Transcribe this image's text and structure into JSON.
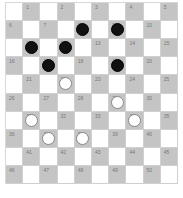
{
  "board": {
    "size": 10,
    "colors": {
      "light_square": "#ffffff",
      "dark_square": "#c4c4c4",
      "black_piece": "#111111",
      "white_piece": "#ffffff"
    },
    "squares": [
      {
        "n": 1,
        "piece": null
      },
      {
        "n": 2,
        "piece": null
      },
      {
        "n": 3,
        "piece": null
      },
      {
        "n": 4,
        "piece": null
      },
      {
        "n": 5,
        "piece": null
      },
      {
        "n": 6,
        "piece": null
      },
      {
        "n": 7,
        "piece": null
      },
      {
        "n": 8,
        "piece": "black"
      },
      {
        "n": 9,
        "piece": "black"
      },
      {
        "n": 10,
        "piece": null
      },
      {
        "n": 11,
        "piece": "black"
      },
      {
        "n": 12,
        "piece": "black"
      },
      {
        "n": 13,
        "piece": null
      },
      {
        "n": 14,
        "piece": null
      },
      {
        "n": 15,
        "piece": null
      },
      {
        "n": 16,
        "piece": null
      },
      {
        "n": 17,
        "piece": "black"
      },
      {
        "n": 18,
        "piece": null
      },
      {
        "n": 19,
        "piece": "black"
      },
      {
        "n": 20,
        "piece": null
      },
      {
        "n": 21,
        "piece": null
      },
      {
        "n": 22,
        "piece": "white"
      },
      {
        "n": 23,
        "piece": null
      },
      {
        "n": 24,
        "piece": null
      },
      {
        "n": 25,
        "piece": null
      },
      {
        "n": 26,
        "piece": null
      },
      {
        "n": 27,
        "piece": null
      },
      {
        "n": 28,
        "piece": null
      },
      {
        "n": 29,
        "piece": "white"
      },
      {
        "n": 30,
        "piece": null
      },
      {
        "n": 31,
        "piece": "white"
      },
      {
        "n": 32,
        "piece": null
      },
      {
        "n": 33,
        "piece": null
      },
      {
        "n": 34,
        "piece": "white"
      },
      {
        "n": 35,
        "piece": null
      },
      {
        "n": 36,
        "piece": null
      },
      {
        "n": 37,
        "piece": "white"
      },
      {
        "n": 38,
        "piece": "white"
      },
      {
        "n": 39,
        "piece": null
      },
      {
        "n": 40,
        "piece": null
      },
      {
        "n": 41,
        "piece": null
      },
      {
        "n": 42,
        "piece": null
      },
      {
        "n": 43,
        "piece": null
      },
      {
        "n": 44,
        "piece": null
      },
      {
        "n": 45,
        "piece": null
      },
      {
        "n": 46,
        "piece": null
      },
      {
        "n": 47,
        "piece": null
      },
      {
        "n": 48,
        "piece": null
      },
      {
        "n": 49,
        "piece": null
      },
      {
        "n": 50,
        "piece": null
      }
    ]
  }
}
